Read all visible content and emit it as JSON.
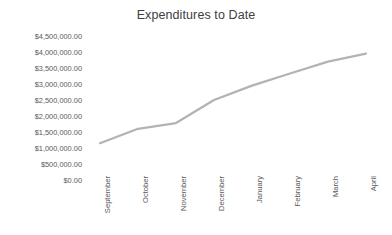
{
  "chart_data": {
    "type": "line",
    "title": "Expenditures to Date",
    "xlabel": "",
    "ylabel": "",
    "categories": [
      "September",
      "October",
      "November",
      "December",
      "January",
      "February",
      "March",
      "April"
    ],
    "values": [
      1150000,
      1600000,
      1780000,
      2500000,
      2950000,
      3330000,
      3700000,
      3950000
    ],
    "series": [
      {
        "name": "Expenditures to Date",
        "values": [
          1150000,
          1600000,
          1780000,
          2500000,
          2950000,
          3330000,
          3700000,
          3950000
        ]
      }
    ],
    "ylim": [
      0,
      4500000
    ],
    "ytick_values": [
      0,
      500000,
      1000000,
      1500000,
      2000000,
      2500000,
      3000000,
      3500000,
      4000000,
      4500000
    ],
    "ytick_labels": [
      "$0.00",
      "$500,000.00",
      "$1,000,000.00",
      "$1,500,000.00",
      "$2,000,000.00",
      "$2,500,000.00",
      "$3,000,000.00",
      "$3,500,000.00",
      "$4,000,000.00",
      "$4,500,000.00"
    ],
    "grid": false,
    "legend": "none",
    "markers": false,
    "line_color": "#b3b3b3",
    "line_width": 2.2,
    "text_color": "#595959",
    "title_color": "#404040",
    "background_color": "#ffffff",
    "xtick_rotation": -90
  }
}
